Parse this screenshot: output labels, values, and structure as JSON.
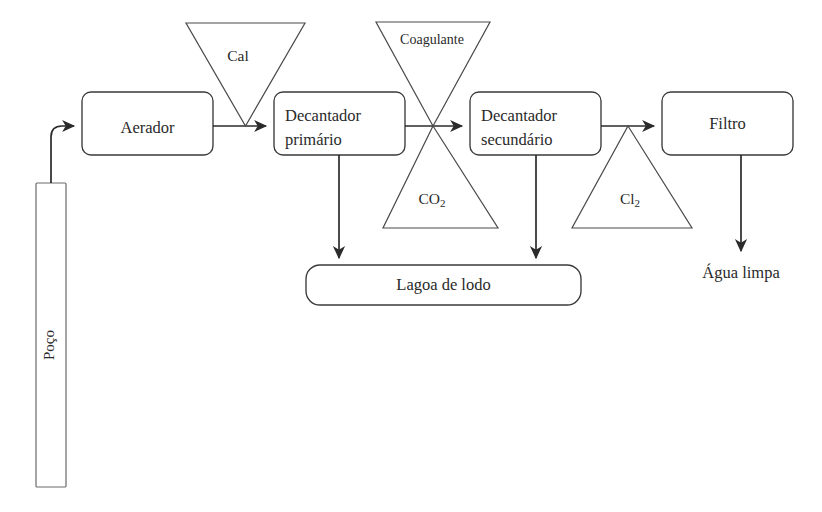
{
  "diagram": {
    "source_vessel": {
      "label": "Poço",
      "name": "well-vessel"
    },
    "process_nodes": [
      {
        "id": "aerador",
        "label": "Aerador",
        "label_line2": ""
      },
      {
        "id": "decantador-primario",
        "label": "Decantador",
        "label_line2": "primário"
      },
      {
        "id": "decantador-secundario",
        "label": "Decantador",
        "label_line2": "secundário"
      },
      {
        "id": "filtro",
        "label": "Filtro",
        "label_line2": ""
      }
    ],
    "sludge_node": {
      "id": "lagoa-de-lodo",
      "label": "Lagoa de lodo"
    },
    "additive_hoppers": [
      {
        "id": "cal",
        "label": "Cal",
        "orientation": "down",
        "formula": false
      },
      {
        "id": "coagulante",
        "label": "Coagulante",
        "orientation": "down",
        "formula": false
      },
      {
        "id": "co2",
        "label": "CO",
        "subscript": "2",
        "orientation": "up",
        "formula": true
      },
      {
        "id": "cl2",
        "label": "Cl",
        "subscript": "2",
        "orientation": "up",
        "formula": true
      }
    ],
    "outputs": [
      {
        "id": "agua-limpa",
        "label": "Água limpa"
      }
    ],
    "colors": {
      "line": "#2b2b2b",
      "node_stroke": "#3a3a3a",
      "hopper_stroke": "#4a4a4a",
      "vessel_stroke": "#6a6a6a",
      "text": "#2a2a2a",
      "background": "#ffffff"
    }
  }
}
